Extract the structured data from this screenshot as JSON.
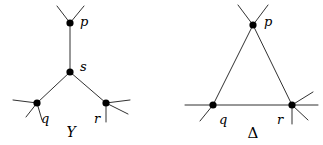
{
  "figure": {
    "background_color": "#ffffff",
    "line_color": "#1a1a1a",
    "vertex_color": "#000000",
    "width": 323,
    "height": 145,
    "diagrams": [
      {
        "id": "y-diagram",
        "name": "Y",
        "caption": "Y",
        "caption_position": {
          "x": 71,
          "y": 137
        },
        "vertices": [
          {
            "id": "p",
            "label": "p",
            "x": 70,
            "y": 23,
            "radius": 3.6,
            "label_x": 80,
            "label_y": 26
          },
          {
            "id": "s",
            "label": "s",
            "x": 70,
            "y": 72,
            "radius": 3.6,
            "label_x": 80,
            "label_y": 71
          },
          {
            "id": "q",
            "label": "q",
            "x": 37,
            "y": 103,
            "radius": 3.6,
            "label_x": 41,
            "label_y": 123
          },
          {
            "id": "r",
            "label": "r",
            "x": 106,
            "y": 103,
            "radius": 3.6,
            "label_x": 94,
            "label_y": 123
          }
        ],
        "edges": [
          {
            "from": "p",
            "to": "s"
          },
          {
            "from": "s",
            "to": "q"
          },
          {
            "from": "s",
            "to": "r"
          }
        ],
        "free_ends": [
          {
            "at": "p",
            "x2": 57,
            "y2": 6
          },
          {
            "at": "p",
            "x2": 84,
            "y2": 6
          },
          {
            "at": "q",
            "x2": 13,
            "y2": 100
          },
          {
            "at": "q",
            "x2": 26,
            "y2": 117
          },
          {
            "at": "q",
            "x2": 42,
            "y2": 120
          },
          {
            "at": "r",
            "x2": 130,
            "y2": 100
          },
          {
            "at": "r",
            "x2": 128,
            "y2": 114
          },
          {
            "at": "r",
            "x2": 106,
            "y2": 122
          }
        ]
      },
      {
        "id": "delta-diagram",
        "name": "Delta",
        "caption": "Δ",
        "caption_position": {
          "x": 253,
          "y": 138
        },
        "vertices": [
          {
            "id": "p",
            "label": "p",
            "x": 253,
            "y": 25,
            "radius": 3.6,
            "label_x": 264,
            "label_y": 26
          },
          {
            "id": "q",
            "label": "q",
            "x": 213,
            "y": 105,
            "radius": 3.6,
            "label_x": 219,
            "label_y": 124
          },
          {
            "id": "r",
            "label": "r",
            "x": 292,
            "y": 105,
            "radius": 3.6,
            "label_x": 277,
            "label_y": 124
          }
        ],
        "edges": [
          {
            "from": "p",
            "to": "q"
          },
          {
            "from": "p",
            "to": "r"
          },
          {
            "from": "q",
            "to": "r"
          }
        ],
        "free_ends": [
          {
            "at": "p",
            "x2": 238,
            "y2": 5
          },
          {
            "at": "p",
            "x2": 268,
            "y2": 5
          },
          {
            "at": "q",
            "x2": 185,
            "y2": 105
          },
          {
            "at": "q",
            "x2": 200,
            "y2": 121
          },
          {
            "at": "r",
            "x2": 318,
            "y2": 105
          },
          {
            "at": "r",
            "x2": 313,
            "y2": 92
          },
          {
            "at": "r",
            "x2": 308,
            "y2": 120
          },
          {
            "at": "r",
            "x2": 292,
            "y2": 124
          }
        ]
      }
    ]
  }
}
